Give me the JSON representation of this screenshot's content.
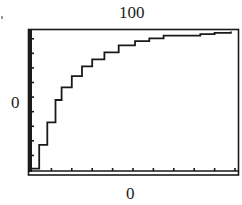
{
  "chart_data": {
    "type": "line",
    "title": "",
    "xlabel": "",
    "ylabel": "",
    "tick_labels": {
      "top": "100",
      "left": "0",
      "bottom": "0"
    },
    "xlim": [
      0,
      10
    ],
    "ylim": [
      0,
      100
    ],
    "x_ticks_count": 10,
    "y_ticks_count": 9,
    "grid": false,
    "legend": null,
    "series": [
      {
        "name": "curve",
        "x": [
          0,
          0.4,
          0.8,
          1.2,
          1.5,
          2.0,
          2.5,
          3.0,
          3.6,
          4.3,
          5.1,
          5.8,
          6.5,
          7.3,
          8.3,
          9.0,
          9.8
        ],
        "values": [
          1,
          18,
          34,
          50,
          59,
          67,
          74,
          79,
          84,
          89,
          92,
          94,
          96,
          96,
          97,
          98,
          99
        ]
      }
    ],
    "colors": {
      "line": "#1a1a1a",
      "frame": "#1a1a1a",
      "background": "#ffffff"
    }
  }
}
